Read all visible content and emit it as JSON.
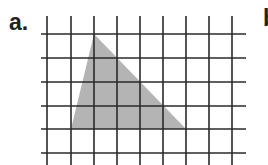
{
  "figure": {
    "label_a": "a.",
    "label_b": "b"
  },
  "grid": {
    "vertical_x": [
      47,
      71,
      94,
      117,
      140,
      163,
      186,
      209,
      232
    ],
    "horizontal_y": [
      34,
      58,
      82,
      106,
      129,
      153
    ],
    "x_extent": [
      41,
      246
    ],
    "y_extent": [
      16,
      165
    ],
    "line_color": "#2a2a2a"
  },
  "triangle": {
    "points": [
      [
        94,
        34
      ],
      [
        71,
        129
      ],
      [
        186,
        129
      ]
    ],
    "fill": "#b4b4b4"
  }
}
